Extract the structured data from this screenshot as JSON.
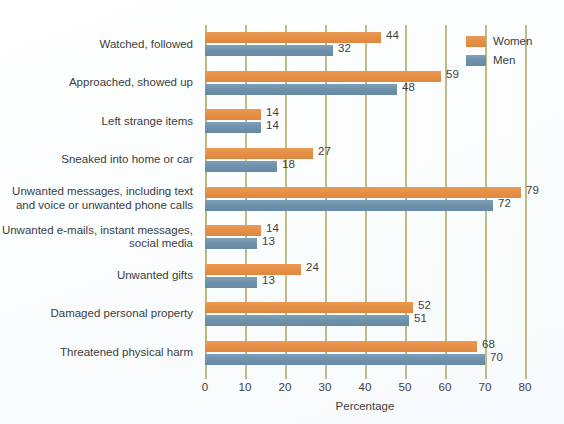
{
  "chart_data": {
    "type": "bar",
    "orientation": "horizontal",
    "title": "",
    "xlabel": "Percentage",
    "ylabel": "",
    "xlim": [
      0,
      80
    ],
    "xticks": [
      0,
      10,
      20,
      30,
      40,
      50,
      60,
      70,
      80
    ],
    "grid": true,
    "legend_position": "top-right",
    "categories": [
      "Watched, followed",
      "Approached, showed up",
      "Left strange items",
      "Sneaked into home or car",
      "Unwanted messages, including text\nand voice or unwanted phone calls",
      "Unwanted e-mails, instant messages,\nsocial media",
      "Unwanted gifts",
      "Damaged personal property",
      "Threatened physical harm"
    ],
    "series": [
      {
        "name": "Women",
        "color": "#e68f45",
        "values": [
          44,
          59,
          14,
          27,
          79,
          14,
          24,
          52,
          68
        ]
      },
      {
        "name": "Men",
        "color": "#6d90ab",
        "values": [
          32,
          48,
          14,
          18,
          72,
          13,
          13,
          51,
          70
        ]
      }
    ]
  },
  "axis": {
    "x_title": "Percentage",
    "tick_labels": [
      "0",
      "10",
      "20",
      "30",
      "40",
      "50",
      "60",
      "70",
      "80"
    ]
  },
  "legend": {
    "items": [
      {
        "label": "Women",
        "color": "#e68f45"
      },
      {
        "label": "Men",
        "color": "#6d90ab"
      }
    ]
  },
  "colors": {
    "women": "#e68f45",
    "men": "#6d90ab",
    "gridline": "#bdbd83",
    "text": "#3f3f40",
    "background": "#fbfdfe"
  }
}
